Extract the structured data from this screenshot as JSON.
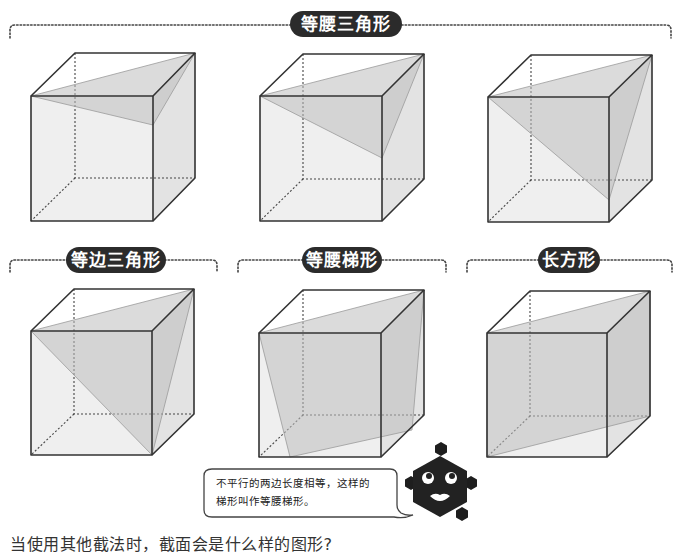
{
  "labels": {
    "isosceles_triangle": "等腰三角形",
    "equilateral_triangle": "等边三角形",
    "isosceles_trapezoid": "等腰梯形",
    "rectangle": "长方形"
  },
  "speech_bubble": {
    "line1": "不平行的两边长度相等，这样的",
    "line2": "梯形叫作等腰梯形。"
  },
  "caption": "当使用其他截法时，截面会是什么样的图形?",
  "colors": {
    "pill_bg": "#2b2b2b",
    "cube_edge": "#333333",
    "front_face": "#efefef",
    "side_face": "#e2e2e2",
    "section": "#cfcfcf"
  },
  "cubes": [
    {
      "name": "cube-isosceles-1",
      "section": "isosceles triangle (small)"
    },
    {
      "name": "cube-isosceles-2",
      "section": "isosceles triangle (medium)"
    },
    {
      "name": "cube-isosceles-3",
      "section": "isosceles triangle (large)"
    },
    {
      "name": "cube-equilateral",
      "section": "equilateral triangle"
    },
    {
      "name": "cube-trapezoid",
      "section": "isosceles trapezoid"
    },
    {
      "name": "cube-rectangle",
      "section": "rectangle"
    }
  ]
}
